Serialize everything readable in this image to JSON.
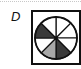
{
  "option": {
    "label": "D"
  },
  "figure": {
    "type": "fraction-circle",
    "segments_total": 8,
    "colors": {
      "dark": "#3a3a3a",
      "light": "#a8a8a8",
      "empty": "#ffffff",
      "stroke": "#111111"
    },
    "segments": [
      {
        "index": 0,
        "from_deg": 0,
        "to_deg": 45,
        "fill": "empty"
      },
      {
        "index": 1,
        "from_deg": 45,
        "to_deg": 90,
        "fill": "empty"
      },
      {
        "index": 2,
        "from_deg": 90,
        "to_deg": 135,
        "fill": "empty"
      },
      {
        "index": 3,
        "from_deg": 135,
        "to_deg": 180,
        "fill": "dark"
      },
      {
        "index": 4,
        "from_deg": 180,
        "to_deg": 225,
        "fill": "light"
      },
      {
        "index": 5,
        "from_deg": 225,
        "to_deg": 270,
        "fill": "empty"
      },
      {
        "index": 6,
        "from_deg": 270,
        "to_deg": 315,
        "fill": "dark"
      },
      {
        "index": 7,
        "from_deg": 315,
        "to_deg": 360,
        "fill": "empty"
      }
    ]
  }
}
